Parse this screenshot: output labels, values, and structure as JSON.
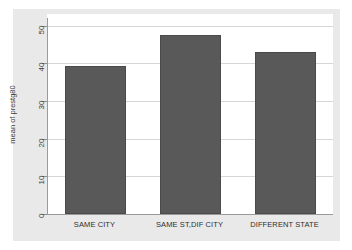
{
  "chart_data": {
    "type": "bar",
    "title": "",
    "xlabel": "",
    "ylabel": "mean of prestg80",
    "categories": [
      "SAME CITY",
      "SAME ST,DIF CITY",
      "DIFFERENT STATE"
    ],
    "values": [
      39.3,
      47.5,
      43.1
    ],
    "ylim": [
      0,
      52
    ],
    "yticks": [
      0,
      10,
      20,
      30,
      40,
      50
    ],
    "ytick_labels": [
      "0",
      "10",
      "20",
      "30",
      "40",
      "50"
    ],
    "grid": true,
    "legend": "none",
    "bar_color": "#595959",
    "plot_background": "#ffffff",
    "frame_background": "#e9e9e9",
    "gridline_color": "#d6d6d6",
    "axis_color": "#9a9a9a"
  }
}
